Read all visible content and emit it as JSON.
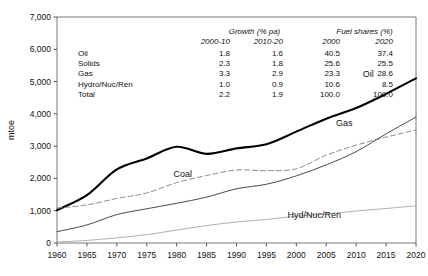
{
  "chart_data": {
    "type": "line",
    "title": "",
    "xlabel": "",
    "ylabel": "mtoe",
    "xlim": [
      1960,
      2020
    ],
    "ylim": [
      0,
      7000
    ],
    "yticks": [
      "0",
      "1,000",
      "2,000",
      "3,000",
      "4,000",
      "5,000",
      "6,000",
      "7,000"
    ],
    "ytick_values": [
      0,
      1000,
      2000,
      3000,
      4000,
      5000,
      6000,
      7000
    ],
    "xticks": [
      "1960",
      "1965",
      "1970",
      "1975",
      "1980",
      "1985",
      "1990",
      "1995",
      "2000",
      "2005",
      "2010",
      "2015",
      "2020"
    ],
    "xtick_values": [
      1960,
      1965,
      1970,
      1975,
      1980,
      1985,
      1990,
      1995,
      2000,
      2005,
      2010,
      2015,
      2020
    ],
    "grid": false,
    "legend": "inline-labels",
    "x": [
      1960,
      1965,
      1970,
      1975,
      1980,
      1985,
      1990,
      1995,
      2000,
      2005,
      2010,
      2015,
      2020
    ],
    "series": [
      {
        "name": "Oil",
        "label": "Oil",
        "style": "solid-bold",
        "color": "#000000",
        "values": [
          1020,
          1480,
          2280,
          2620,
          2980,
          2760,
          2930,
          3060,
          3450,
          3850,
          4180,
          4620,
          5100
        ]
      },
      {
        "name": "Coal",
        "label": "Coal",
        "style": "dashed",
        "color": "#8a8a8a",
        "values": [
          1080,
          1180,
          1380,
          1550,
          1870,
          2090,
          2260,
          2240,
          2300,
          2720,
          3030,
          3280,
          3500
        ]
      },
      {
        "name": "Gas",
        "label": "Gas",
        "style": "solid-thin",
        "color": "#4a4a4a",
        "values": [
          350,
          560,
          880,
          1060,
          1230,
          1420,
          1680,
          1820,
          2080,
          2420,
          2830,
          3380,
          3900
        ]
      },
      {
        "name": "Hyd/Nuc/Ren",
        "label": "Hyd/Nuc/Ren",
        "style": "solid-light",
        "color": "#a8a8a8",
        "values": [
          30,
          80,
          160,
          260,
          400,
          540,
          650,
          730,
          830,
          900,
          990,
          1070,
          1150
        ]
      }
    ],
    "annotations": [
      {
        "text": "Oil",
        "x": 2012,
        "y": 5150
      },
      {
        "text": "Gas",
        "x": 2008,
        "y": 3620
      },
      {
        "text": "Coal",
        "x": 1981,
        "y": 2030
      },
      {
        "text": "Hyd/Nuc/Ren",
        "x": 2003,
        "y": 760
      }
    ]
  },
  "table": {
    "group_headers": [
      "Growth (% pa)",
      "Fuel shares (%)"
    ],
    "columns": [
      "2000-10",
      "2010-20",
      "2000",
      "2020"
    ],
    "rows": [
      {
        "label": "Oil",
        "values": [
          "1.8",
          "1.6",
          "40.5",
          "37.4"
        ]
      },
      {
        "label": "Solids",
        "values": [
          "2.3",
          "1.8",
          "25.6",
          "25.5"
        ]
      },
      {
        "label": "Gas",
        "values": [
          "3.3",
          "2.9",
          "23.3",
          "28.6"
        ]
      },
      {
        "label": "Hydro/Nuc/Ren",
        "values": [
          "1.0",
          "0.9",
          "10.6",
          "8.5"
        ]
      },
      {
        "label": "Total",
        "values": [
          "2.2",
          "1.9",
          "100.0",
          "100.0"
        ]
      }
    ]
  }
}
